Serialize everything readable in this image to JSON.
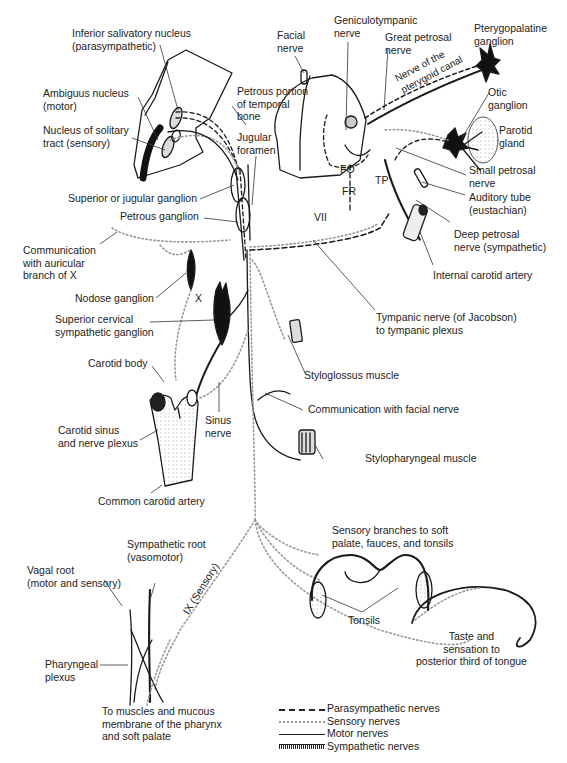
{
  "figure": {
    "labels": {
      "inferior_salivatory": "Inferior salivatory nucleus\n(parasympathetic)",
      "ambiguus": "Ambiguus nucleus\n(motor)",
      "solitary": "Nucleus of solitary\ntract (sensory)",
      "petrous_portion": "Petrous portion\nof temporal\nbone",
      "jugular_foramen": "Jugular\nforamen",
      "facial_nerve": "Facial\nnerve",
      "geniculotympanic": "Geniculotympanic\nnerve",
      "great_petrosal": "Great petrosal\nnerve",
      "pterygopalatine": "Pterygopalatine\nganglion",
      "pterygoid_canal": "Nerve of the\npterygoid canal",
      "otic_ganglion": "Otic\nganglion",
      "parotid": "Parotid\ngland",
      "small_petrosal": "Small petrosal\nnerve",
      "auditory_tube": "Auditory tube\n(eustachian)",
      "deep_petrosal": "Deep petrosal\nnerve (sympathetic)",
      "internal_carotid": "Internal carotid artery",
      "fo": "FO",
      "fr": "FR",
      "tp": "TP",
      "vii": "VII",
      "superior_jugular": "Superior or jugular ganglion",
      "petrous_ganglion": "Petrous ganglion",
      "auricular": "Communication\nwith auricular\nbranch of X",
      "nodose": "Nodose ganglion",
      "x": "X",
      "superior_cervical": "Superior cervical\nsympathetic ganglion",
      "tympanic_nerve": "Tympanic nerve (of Jacobson)\nto tympanic plexus",
      "styloglossus": "Styloglossus muscle",
      "carotid_body": "Carotid body",
      "carotid_sinus": "Carotid sinus\nand nerve plexus",
      "sinus_nerve": "Sinus\nnerve",
      "communication_facial": "Communication with facial nerve",
      "stylopharyngeal": "Stylopharyngeal muscle",
      "common_carotid": "Common carotid artery",
      "sensory_branches": "Sensory branches to soft\npalate, fauces, and tonsils",
      "sympathetic_root": "Sympathetic root\n(vasomotor)",
      "vagal_root": "Vagal root\n(motor and sensory)",
      "ix_sensory": "IX (Sensory)",
      "tonsils": "Tonsils",
      "taste": "Taste and\nsensation to\nposterior third of tongue",
      "pharyngeal_plexus": "Pharyngeal\nplexus",
      "to_muscles": "To muscles and mucous\nmembrane of the pharynx\nand soft palate"
    },
    "legend": [
      {
        "style": "dashed",
        "label": "Parasympathetic nerves"
      },
      {
        "style": "dotted",
        "label": "Sensory nerves"
      },
      {
        "style": "solid",
        "label": "Motor nerves"
      },
      {
        "style": "hatched",
        "label": "Sympathetic nerves"
      }
    ],
    "colors": {
      "ink": "#1a1a1a",
      "sensory_dots": "#999999",
      "background": "#ffffff"
    }
  }
}
